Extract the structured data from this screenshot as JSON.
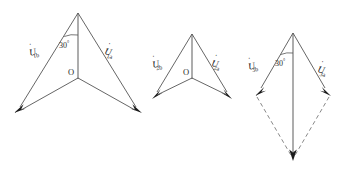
{
  "figure": {
    "background_color": "#ffffff",
    "line_color": "#555555",
    "arrow_color": "#1a1a1a",
    "text_color": "#2b2b2b",
    "width": 353,
    "height": 173
  },
  "diagrams": [
    {
      "id": "diagram-1",
      "angle_label": "30",
      "degree_symbol": "°",
      "origin_label": "O",
      "left_vector": {
        "symbol": "U",
        "dot": "̇",
        "prime": "′",
        "subscript": "1b",
        "full": "U̇′1b"
      },
      "right_vector": {
        "symbol": "U",
        "dot": "̇",
        "prime": "′",
        "subscript": "1a",
        "full": "U̇′1a"
      },
      "has_dashed": false,
      "has_resultant": false
    },
    {
      "id": "diagram-2",
      "angle_label": "",
      "degree_symbol": "",
      "origin_label": "O",
      "left_vector": {
        "symbol": "U",
        "dot": "̇",
        "prime": "′",
        "subscript": "2b",
        "full": "U̇′2b"
      },
      "right_vector": {
        "symbol": "U",
        "dot": "̇",
        "prime": "′",
        "subscript": "2a",
        "full": "U̇′2a"
      },
      "has_dashed": false,
      "has_resultant": false
    },
    {
      "id": "diagram-3",
      "angle_label": "30",
      "degree_symbol": "°",
      "origin_label": "",
      "left_vector": {
        "symbol": "U",
        "dot": "̇",
        "prime": "′",
        "subscript": "3b",
        "full": "U̇′3b"
      },
      "right_vector": {
        "symbol": "U",
        "dot": "̇",
        "prime": "′",
        "subscript": "3a",
        "full": "U̇′3a"
      },
      "has_dashed": true,
      "has_resultant": true
    }
  ]
}
